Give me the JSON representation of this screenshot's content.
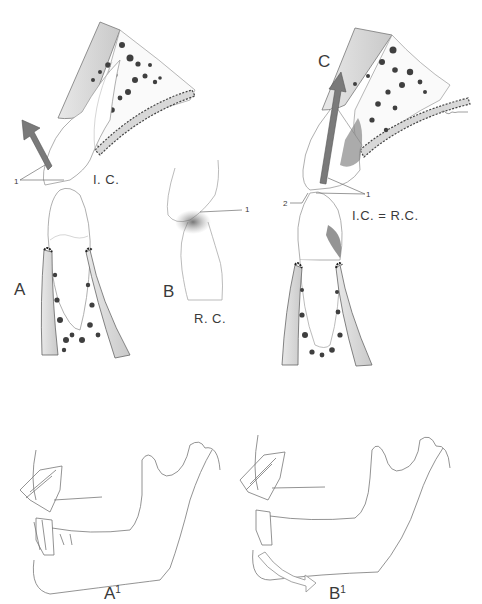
{
  "figure": {
    "panels": [
      {
        "id": "A",
        "label": "A",
        "caption": "I. C.",
        "callouts": [
          "1"
        ]
      },
      {
        "id": "B",
        "label": "B",
        "caption": "R. C.",
        "callouts": [
          "1"
        ]
      },
      {
        "id": "C",
        "label": "C",
        "caption": "I.C. = R.C.",
        "callouts": [
          "1",
          "2"
        ]
      },
      {
        "id": "A1",
        "label": "A",
        "sup": "1"
      },
      {
        "id": "B1",
        "label": "B",
        "sup": "1"
      }
    ],
    "colors": {
      "arrow": "#7a7a7a",
      "bone_dots": "#3f3f3f",
      "line": "#6b6b6b",
      "outline_arrow": "#9a9a9a"
    }
  }
}
